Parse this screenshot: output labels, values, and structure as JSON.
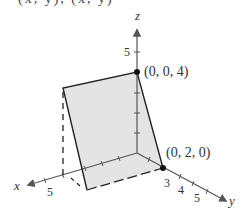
{
  "header": {
    "clipped_text": "(x, y), (x, y)"
  },
  "diagram": {
    "axes": {
      "z": {
        "label": "z",
        "tick_label": "5"
      },
      "x": {
        "label": "x",
        "tick_label": "5"
      },
      "y": {
        "label": "y",
        "tick_labels": [
          "3",
          "4",
          "5"
        ]
      }
    },
    "points": [
      {
        "label": "(0, 0, 4)"
      },
      {
        "label": "(0, 2, 0)"
      }
    ],
    "plane_fill": "#e4e4e4",
    "stroke_color": "#222222"
  }
}
